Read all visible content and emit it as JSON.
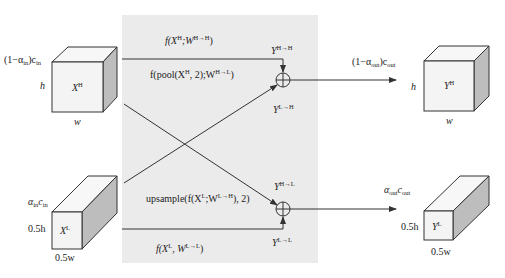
{
  "colors": {
    "panel_bg": "#ebebeb",
    "line": "#333333",
    "cube_front": "#f4f4f4",
    "cube_top": "#f7f7f7",
    "cube_side": "#bdbdbd"
  },
  "inputs": {
    "high": {
      "channels_prefix": "(1−α",
      "channels_sub1": "in",
      "channels_mid": ")c",
      "channels_sub2": "in",
      "height": "h",
      "width": "w",
      "name": "X",
      "name_sup": "H"
    },
    "low": {
      "channels_a": "α",
      "channels_sub1": "in",
      "channels_c": "c",
      "channels_sub2": "in",
      "height": "0.5h",
      "width": "0.5w",
      "name": "X",
      "name_sup": "L"
    }
  },
  "operations": {
    "hh": {
      "text_pre": "f(X",
      "sup1": "H",
      "text_mid": ";W",
      "sup2": "H→H",
      "text_post": ")"
    },
    "hl": {
      "text_pre": "f(pool(X",
      "sup1": "H",
      "text_mid": ", 2);W",
      "sup2": "H→L",
      "text_post": ")"
    },
    "lh": {
      "text_pre": "upsample(f(X",
      "sup1": "L",
      "text_mid": ";W",
      "sup2": "L→H",
      "text_post": "), 2)"
    },
    "ll": {
      "text_pre": "f(X",
      "sup1": "L",
      "text_mid": ", W",
      "sup2": "L→L",
      "text_post": ")"
    }
  },
  "intermediates": {
    "y_hh": {
      "name": "Y",
      "sup": "H→H"
    },
    "y_lh": {
      "name": "Y",
      "sup": "L→H"
    },
    "y_hl": {
      "name": "Y",
      "sup": "H→L"
    },
    "y_ll": {
      "name": "Y",
      "sup": "L→L"
    }
  },
  "outputs": {
    "high": {
      "channels_prefix": "(1−α",
      "channels_sub1": "out",
      "channels_mid": ")c",
      "channels_sub2": "out",
      "height": "h",
      "width": "w",
      "name": "Y",
      "name_sup": "H"
    },
    "low": {
      "channels_a": "α",
      "channels_sub1": "out",
      "channels_c": "c",
      "channels_sub2": "out",
      "height": "0.5h",
      "width": "0.5w",
      "name": "Y",
      "name_sup": "L"
    }
  }
}
